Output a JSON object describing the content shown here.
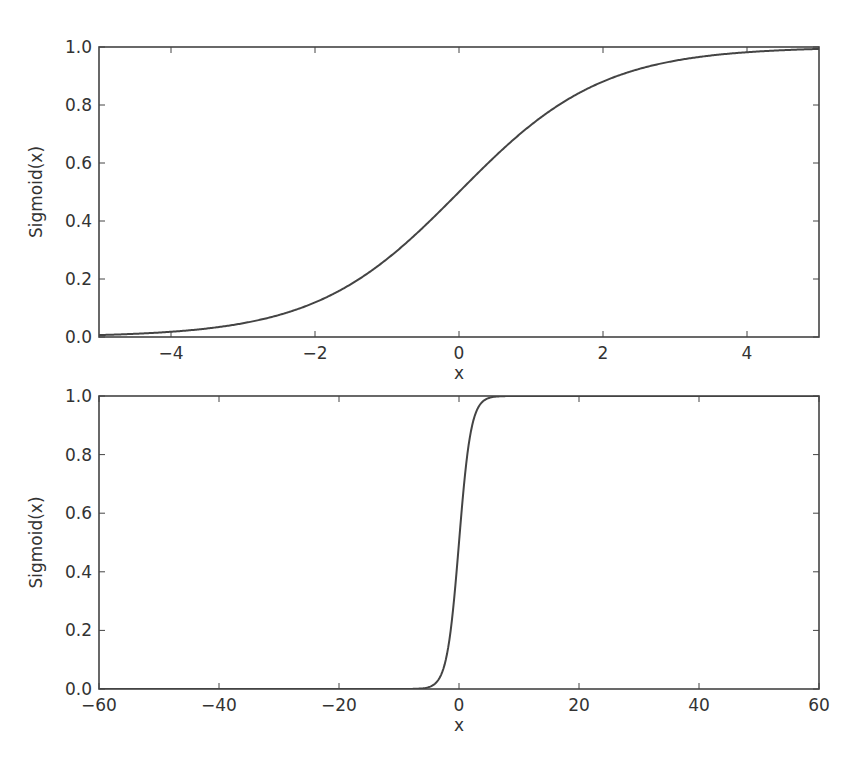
{
  "figure": {
    "background": "#ffffff",
    "line_color": "#444444",
    "text_color": "#333333",
    "frame_color": "#444444"
  },
  "chart_data": [
    {
      "type": "line",
      "title": "",
      "xlabel": "x",
      "ylabel": "Sigmoid(x)",
      "xlim": [
        -5,
        5
      ],
      "ylim": [
        0.0,
        1.0
      ],
      "grid": false,
      "legend": null,
      "xticks": [
        -4,
        -2,
        0,
        2,
        4
      ],
      "xtick_labels": [
        "−4",
        "−2",
        "0",
        "2",
        "4"
      ],
      "yticks": [
        0.0,
        0.2,
        0.4,
        0.6,
        0.8,
        1.0
      ],
      "ytick_labels": [
        "0.0",
        "0.2",
        "0.4",
        "0.6",
        "0.8",
        "1.0"
      ],
      "series": [
        {
          "name": "Sigmoid(x)",
          "function": "1/(1+exp(-x))",
          "x": [
            -5,
            -4.5,
            -4,
            -3.5,
            -3,
            -2.5,
            -2,
            -1.5,
            -1,
            -0.5,
            0,
            0.5,
            1,
            1.5,
            2,
            2.5,
            3,
            3.5,
            4,
            4.5,
            5
          ],
          "y": [
            0.0067,
            0.011,
            0.018,
            0.0293,
            0.0474,
            0.0759,
            0.1192,
            0.1824,
            0.2689,
            0.3775,
            0.5,
            0.6225,
            0.7311,
            0.8176,
            0.8808,
            0.9241,
            0.9526,
            0.9707,
            0.982,
            0.989,
            0.9933
          ]
        }
      ],
      "layout": {
        "left": 99,
        "top": 47,
        "right": 819,
        "bottom": 337
      }
    },
    {
      "type": "line",
      "title": "",
      "xlabel": "x",
      "ylabel": "Sigmoid(x)",
      "xlim": [
        -60,
        60
      ],
      "ylim": [
        0.0,
        1.0
      ],
      "grid": false,
      "legend": null,
      "xticks": [
        -60,
        -40,
        -20,
        0,
        20,
        40,
        60
      ],
      "xtick_labels": [
        "−60",
        "−40",
        "−20",
        "0",
        "20",
        "40",
        "60"
      ],
      "yticks": [
        0.0,
        0.2,
        0.4,
        0.6,
        0.8,
        1.0
      ],
      "ytick_labels": [
        "0.0",
        "0.2",
        "0.4",
        "0.6",
        "0.8",
        "1.0"
      ],
      "series": [
        {
          "name": "Sigmoid(x)",
          "function": "1/(1+exp(-x))",
          "x": [
            -60,
            -40,
            -20,
            -10,
            -8,
            -6,
            -5,
            -4,
            -3,
            -2,
            -1,
            0,
            1,
            2,
            3,
            4,
            5,
            6,
            8,
            10,
            20,
            40,
            60
          ],
          "y": [
            0.0,
            0.0,
            0.0,
            0.0,
            0.0003,
            0.0025,
            0.0067,
            0.018,
            0.0474,
            0.1192,
            0.2689,
            0.5,
            0.7311,
            0.8808,
            0.9526,
            0.982,
            0.9933,
            0.9975,
            0.9997,
            1.0,
            1.0,
            1.0,
            1.0
          ]
        }
      ],
      "layout": {
        "left": 99,
        "top": 396,
        "right": 819,
        "bottom": 689
      }
    }
  ]
}
